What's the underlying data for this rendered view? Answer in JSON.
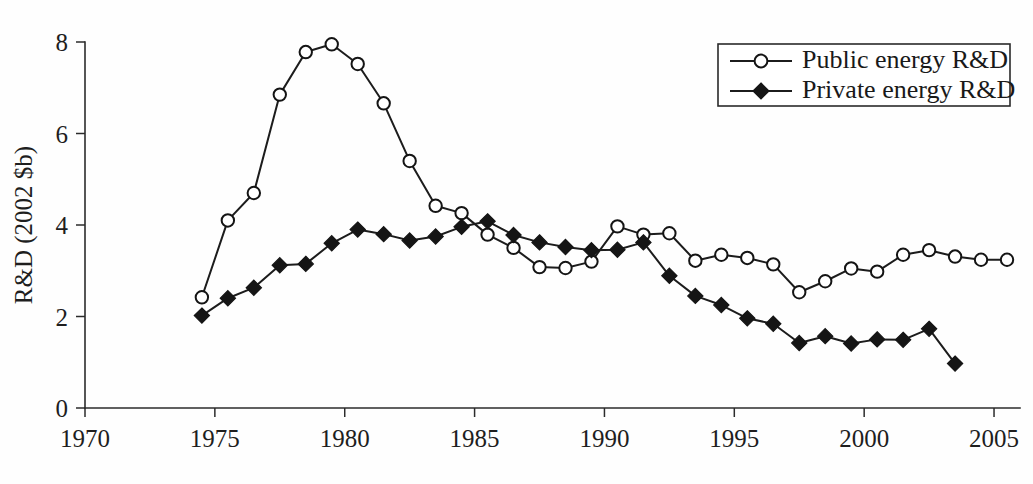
{
  "chart_data": {
    "type": "line",
    "title": "",
    "xlabel": "",
    "ylabel": "R&D (2002 $b)",
    "xlim": [
      1970,
      2006
    ],
    "ylim": [
      0,
      8
    ],
    "xticks": [
      1970,
      1975,
      1980,
      1985,
      1990,
      1995,
      2000,
      2005
    ],
    "yticks": [
      0,
      2,
      4,
      6,
      8
    ],
    "grid": false,
    "legend_position": "top-right",
    "series": [
      {
        "name": "Public energy R&D",
        "marker": "open-circle",
        "x": [
          1974.5,
          1975.5,
          1976.5,
          1977.5,
          1978.5,
          1979.5,
          1980.5,
          1981.5,
          1982.5,
          1983.5,
          1984.5,
          1985.5,
          1986.5,
          1987.5,
          1988.5,
          1989.5,
          1990.5,
          1991.5,
          1992.5,
          1993.5,
          1994.5,
          1995.5,
          1996.5,
          1997.5,
          1998.5,
          1999.5,
          2000.5,
          2001.5,
          2002.5,
          2003.5,
          2004.5,
          2005.5
        ],
        "values": [
          2.42,
          4.1,
          4.7,
          6.85,
          7.78,
          7.95,
          7.52,
          6.66,
          5.4,
          4.42,
          4.26,
          3.79,
          3.5,
          3.08,
          3.06,
          3.2,
          3.97,
          3.79,
          3.82,
          3.22,
          3.35,
          3.28,
          3.14,
          2.53,
          2.77,
          3.05,
          2.98,
          3.35,
          3.45,
          3.31,
          3.24,
          3.24
        ]
      },
      {
        "name": "Private energy R&D",
        "marker": "filled-diamond",
        "x": [
          1974.5,
          1975.5,
          1976.5,
          1977.5,
          1978.5,
          1979.5,
          1980.5,
          1981.5,
          1982.5,
          1983.5,
          1984.5,
          1985.5,
          1986.5,
          1987.5,
          1988.5,
          1989.5,
          1990.5,
          1991.5,
          1992.5,
          1993.5,
          1994.5,
          1995.5,
          1996.5,
          1997.5,
          1998.5,
          1999.5,
          2000.5,
          2001.5,
          2002.5,
          2003.5
        ],
        "values": [
          2.02,
          2.4,
          2.63,
          3.12,
          3.15,
          3.6,
          3.9,
          3.8,
          3.66,
          3.75,
          3.96,
          4.08,
          3.78,
          3.62,
          3.52,
          3.45,
          3.46,
          3.62,
          2.89,
          2.45,
          2.25,
          1.96,
          1.84,
          1.42,
          1.57,
          1.41,
          1.5,
          1.49,
          1.73,
          0.97
        ]
      }
    ]
  },
  "legend": {
    "entries": [
      {
        "label": "Public energy R&D",
        "marker": "open-circle"
      },
      {
        "label": "Private energy R&D",
        "marker": "filled-diamond"
      }
    ]
  },
  "axes": {
    "y_title": "R&D (2002 $b)",
    "y_tick_labels": [
      "0",
      "2",
      "4",
      "6",
      "8"
    ],
    "x_tick_labels": [
      "1970",
      "1975",
      "1980",
      "1985",
      "1990",
      "1995",
      "2000",
      "2005"
    ]
  }
}
